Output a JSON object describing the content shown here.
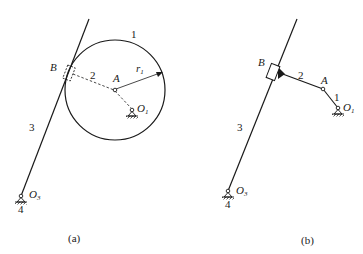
{
  "figures": [
    {
      "id": "a",
      "caption": "(a)",
      "labels": {
        "link1": "1",
        "slider_point": "B",
        "link2": "2",
        "center": "A",
        "radius": "r",
        "radius_sub": "1",
        "link3": "3",
        "pivot_o1": "O",
        "pivot_o1_sub": "1",
        "pivot_o3": "O",
        "pivot_o3_sub": "3",
        "ground": "4"
      },
      "description": "Circular disc 1 (radius r1) pivoting eccentrically at O1, in contact at B with straight link 3 pivoted at O3; equivalent link 2 shown dashed from A to B"
    },
    {
      "id": "b",
      "caption": "(b)",
      "labels": {
        "link1": "1",
        "slider_point": "B",
        "link2": "2",
        "joint": "A",
        "link3": "3",
        "pivot_o1": "O",
        "pivot_o1_sub": "1",
        "pivot_o3": "O",
        "pivot_o3_sub": "3",
        "ground": "4"
      },
      "description": "Equivalent linkage: crank 1 (O1A), link 2 (AB) rigidly attached to slider B which slides on link 3 pivoted at O3"
    }
  ],
  "colors": {
    "stroke": "#1a1a1a",
    "background": "#ffffff"
  }
}
